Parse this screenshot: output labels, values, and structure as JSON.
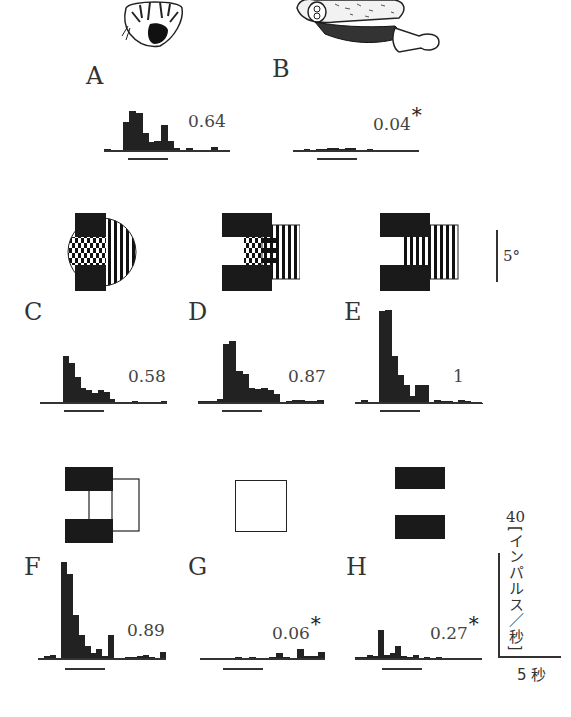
{
  "figure": {
    "panels": {
      "A": {
        "label": "A",
        "value": "0.64",
        "significant": false
      },
      "B": {
        "label": "B",
        "value": "0.04",
        "significant": true
      },
      "C": {
        "label": "C",
        "value": "0.58",
        "significant": false
      },
      "D": {
        "label": "D",
        "value": "0.87",
        "significant": false
      },
      "E": {
        "label": "E",
        "value": "1",
        "significant": false
      },
      "F": {
        "label": "F",
        "value": "0.89",
        "significant": false
      },
      "G": {
        "label": "G",
        "value": "0.06",
        "significant": true
      },
      "H": {
        "label": "H",
        "value": "0.27",
        "significant": true
      }
    },
    "asterisk": "*",
    "angle_scale_label": "5°",
    "rate_scale_value": "40",
    "rate_scale_unit": "[インパルス／秒]",
    "time_scale_label": "5 秒"
  },
  "chart_data": {
    "type": "bar",
    "title": "",
    "xlabel": "time (scale bar 5 秒)",
    "ylabel": "40 [インパルス／秒]",
    "panels": [
      {
        "name": "A",
        "stimulus": "monkey face drawing (front view)",
        "normalized_response": 0.64,
        "significant": false,
        "values": [
          2,
          0,
          1,
          22,
          30,
          29,
          14,
          7,
          8,
          20,
          8,
          3,
          0,
          3,
          1,
          0,
          0,
          4,
          0,
          0
        ]
      },
      {
        "name": "B",
        "stimulus": "insect/brush-like object drawing",
        "normalized_response": 0.04,
        "significant": true,
        "values": [
          1,
          1,
          2,
          1,
          2,
          2,
          3,
          3,
          2,
          3,
          3,
          1,
          1,
          2,
          0,
          1,
          0,
          1,
          1,
          0,
          1,
          0
        ]
      },
      {
        "name": "C",
        "stimulus": "black bars with grating in circle",
        "normalized_response": 0.58,
        "significant": false,
        "values": [
          1,
          0,
          1,
          0,
          35,
          30,
          20,
          12,
          10,
          8,
          10,
          9,
          4,
          1,
          1,
          1,
          2,
          1,
          1,
          1,
          0,
          2
        ]
      },
      {
        "name": "D",
        "stimulus": "black bars with grating rectangle",
        "normalized_response": 0.87,
        "significant": false,
        "values": [
          2,
          2,
          2,
          4,
          44,
          46,
          24,
          22,
          12,
          11,
          12,
          10,
          7,
          0,
          2,
          3,
          3,
          2,
          2,
          3
        ]
      },
      {
        "name": "E",
        "stimulus": "black bars with vertical grating",
        "normalized_response": 1.0,
        "significant": false,
        "values": [
          1,
          3,
          1,
          0,
          68,
          69,
          35,
          21,
          14,
          6,
          14,
          14,
          1,
          3,
          2,
          2,
          0,
          3,
          2,
          1,
          1
        ]
      },
      {
        "name": "F",
        "stimulus": "two black bars with outline rectangle",
        "normalized_response": 0.89,
        "significant": false,
        "values": [
          1,
          3,
          4,
          0,
          72,
          63,
          33,
          18,
          10,
          5,
          8,
          3,
          18,
          1,
          1,
          2,
          2,
          3,
          4,
          2,
          0,
          6
        ]
      },
      {
        "name": "G",
        "stimulus": "empty square outline",
        "normalized_response": 0.06,
        "significant": true,
        "values": [
          1,
          0,
          1,
          0,
          0,
          2,
          0,
          2,
          0,
          1,
          2,
          5,
          2,
          0,
          8,
          3,
          3,
          6
        ]
      },
      {
        "name": "H",
        "stimulus": "two black bars (horizontal gap)",
        "normalized_response": 0.27,
        "significant": true,
        "values": [
          2,
          2,
          4,
          3,
          22,
          4,
          5,
          10,
          3,
          2,
          4,
          1,
          2,
          1,
          2,
          0,
          1,
          1,
          0,
          1,
          0,
          1
        ]
      }
    ],
    "scale_bars": {
      "rate": "40 インパルス／秒",
      "time": "5 秒",
      "angle": "5°"
    }
  }
}
